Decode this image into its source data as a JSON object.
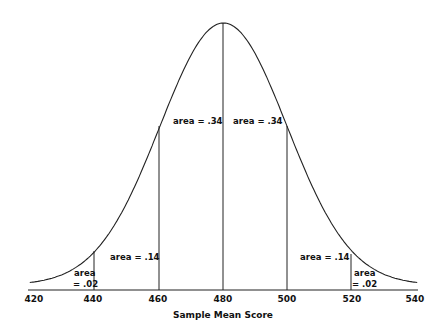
{
  "chart_data": {
    "type": "area",
    "title": "",
    "xlabel": "Sample Mean Score",
    "ylabel": "",
    "distribution": "normal",
    "mean": 480,
    "sd": 20,
    "xlim": [
      420,
      540
    ],
    "grid": false,
    "legend": "none",
    "x_ticks": [
      "420",
      "440",
      "460",
      "480",
      "500",
      "520",
      "540"
    ],
    "dividers": [
      440,
      460,
      480,
      500,
      520
    ],
    "regions": [
      {
        "from": 420,
        "to": 440,
        "area": 0.02,
        "label_line1": "area",
        "label_line2": "= .02"
      },
      {
        "from": 440,
        "to": 460,
        "area": 0.14,
        "label": "area = .14"
      },
      {
        "from": 460,
        "to": 480,
        "area": 0.34,
        "label": "area = .34"
      },
      {
        "from": 480,
        "to": 500,
        "area": 0.34,
        "label": "area = .34"
      },
      {
        "from": 500,
        "to": 520,
        "area": 0.14,
        "label": "area = .14"
      },
      {
        "from": 520,
        "to": 540,
        "area": 0.02,
        "label_line1": "area",
        "label_line2": "= .02"
      }
    ]
  },
  "labels": {
    "r0a": "area",
    "r0b": "= .02",
    "r1": "area = .14",
    "r2": "area = .34",
    "r3": "area = .34",
    "r4": "area = .14",
    "r5a": "area",
    "r5b": "= .02",
    "t420": "420",
    "t440": "440",
    "t460": "460",
    "t480": "480",
    "t500": "500",
    "t520": "520",
    "t540": "540",
    "xlabel": "Sample Mean Score"
  }
}
